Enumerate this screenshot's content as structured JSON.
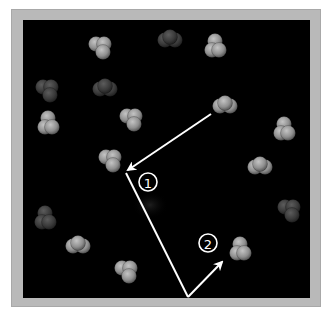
{
  "figure": {
    "type": "molecular-collision-diagram",
    "background_color": "#000000",
    "frame_color": "#b9b9b9",
    "arrow_color": "#ffffff",
    "labels": [
      {
        "id": "1",
        "text": "①",
        "number": "1"
      },
      {
        "id": "2",
        "text": "②",
        "number": "2"
      }
    ],
    "path": {
      "description": "Molecule path: travels from upper right to molecule near label 1, then to bottom edge, then up to molecule near label 2",
      "segments": 3
    },
    "molecules": [
      {
        "x": 100,
        "y": 48,
        "brightness": "bright"
      },
      {
        "x": 170,
        "y": 40,
        "brightness": "dim"
      },
      {
        "x": 215,
        "y": 47,
        "brightness": "bright"
      },
      {
        "x": 47,
        "y": 91,
        "brightness": "dim"
      },
      {
        "x": 105,
        "y": 89,
        "brightness": "dim"
      },
      {
        "x": 48,
        "y": 124,
        "brightness": "bright"
      },
      {
        "x": 131,
        "y": 120,
        "brightness": "bright"
      },
      {
        "x": 225,
        "y": 106,
        "brightness": "bright"
      },
      {
        "x": 284,
        "y": 130,
        "brightness": "bright"
      },
      {
        "x": 110,
        "y": 161,
        "brightness": "bright"
      },
      {
        "x": 260,
        "y": 167,
        "brightness": "bright"
      },
      {
        "x": 45,
        "y": 219,
        "brightness": "dim"
      },
      {
        "x": 289,
        "y": 211,
        "brightness": "dim"
      },
      {
        "x": 78,
        "y": 246,
        "brightness": "bright"
      },
      {
        "x": 240,
        "y": 250,
        "brightness": "bright"
      },
      {
        "x": 126,
        "y": 272,
        "brightness": "bright"
      }
    ]
  }
}
